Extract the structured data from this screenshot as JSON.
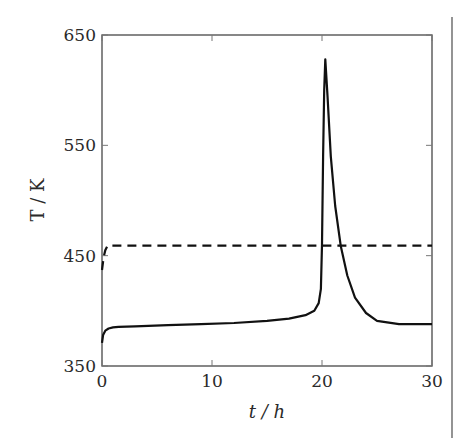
{
  "chart_data": {
    "type": "line",
    "title": "",
    "xlabel": "t / h",
    "ylabel": "T / K",
    "xlim": [
      0,
      30
    ],
    "ylim": [
      350,
      650
    ],
    "xticks": [
      0,
      10,
      20,
      30
    ],
    "yticks": [
      350,
      450,
      550,
      650
    ],
    "xtick_labels": [
      "0",
      "10",
      "20",
      "30"
    ],
    "ytick_labels": [
      "350",
      "450",
      "550",
      "650"
    ],
    "grid": false,
    "legend": null,
    "series": [
      {
        "name": "solid",
        "style": "solid",
        "color": "#111111",
        "x": [
          0,
          0.1,
          0.3,
          0.6,
          1.0,
          1.5,
          3,
          6,
          9,
          12,
          15,
          17,
          18.5,
          19.3,
          19.7,
          19.9,
          20.0,
          20.1,
          20.2,
          20.3,
          20.5,
          20.8,
          21.2,
          21.7,
          22.3,
          23.0,
          24.0,
          25.0,
          27.0,
          30.0
        ],
        "y": [
          371,
          378,
          382,
          384,
          385,
          385.5,
          386,
          387,
          388,
          389,
          391,
          393,
          396,
          400,
          407,
          420,
          460,
          540,
          600,
          628,
          595,
          540,
          495,
          459,
          432,
          412,
          398,
          391,
          388,
          388
        ]
      },
      {
        "name": "dashed",
        "style": "dashed",
        "color": "#111111",
        "x": [
          0,
          0.15,
          0.3,
          0.5,
          1,
          30
        ],
        "y": [
          437,
          449,
          455,
          459,
          459,
          459
        ]
      }
    ]
  },
  "frame": {
    "right_rule": true
  }
}
